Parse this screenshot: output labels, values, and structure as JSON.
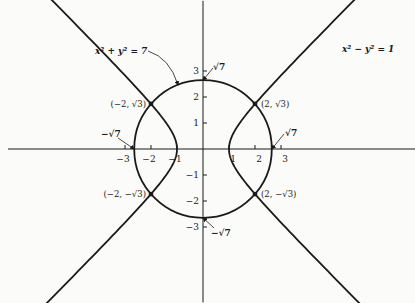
{
  "chart_data": {
    "type": "line",
    "title": "",
    "xlabel": "",
    "ylabel": "",
    "xlim": [
      -7.5,
      8.2
    ],
    "ylim": [
      -5.9,
      5.7
    ],
    "grid": false,
    "x_ticks": [
      -3,
      -2,
      -1,
      1,
      2,
      3
    ],
    "x_tick_labels": [
      "-3",
      "-2",
      "-1",
      "1",
      "2",
      "3"
    ],
    "y_ticks": [
      3,
      2,
      1,
      -1,
      -2,
      -3
    ],
    "y_tick_labels": [
      "3",
      "2",
      "1",
      "-1",
      "-2",
      "-3"
    ],
    "series": [
      {
        "name": "x² + y² = 7",
        "kind": "circle",
        "radius_sq": 7
      },
      {
        "name": "x² − y² = 1",
        "kind": "hyperbola",
        "t_range": [
          -2.5,
          2.5
        ]
      }
    ],
    "intersection_points": [
      {
        "x": -2,
        "y": 1.732,
        "label": "(−2, √3)"
      },
      {
        "x": 2,
        "y": 1.732,
        "label": "(2, √3)"
      },
      {
        "x": -2,
        "y": -1.732,
        "label": "(−2, −√3)"
      },
      {
        "x": 2,
        "y": -1.732,
        "label": "(2, −√3)"
      }
    ],
    "annotations": [
      {
        "text": "x² + y² = 7",
        "target": "circle"
      },
      {
        "text": "x² − y² = 1",
        "target": "hyperbola"
      },
      {
        "text": "√7",
        "at": [
          0,
          2.6458
        ]
      },
      {
        "text": "−√7",
        "at": [
          0,
          -2.6458
        ]
      },
      {
        "text": "−√7",
        "at": [
          -2.6458,
          0
        ]
      },
      {
        "text": "√7",
        "at": [
          2.6458,
          0
        ]
      }
    ]
  },
  "view": {
    "origin_px": [
      203,
      149
    ],
    "scale_px": 26
  }
}
